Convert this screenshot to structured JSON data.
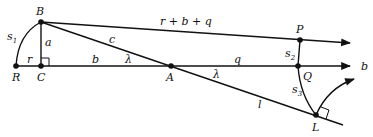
{
  "diagram": {
    "points": {
      "B": {
        "label": "B",
        "x": 41,
        "y": 22
      },
      "R": {
        "label": "R",
        "x": 16,
        "y": 66
      },
      "C": {
        "label": "C",
        "x": 41,
        "y": 66
      },
      "A": {
        "label": "A",
        "x": 171,
        "y": 66
      },
      "P": {
        "label": "P",
        "x": 300,
        "y": 40
      },
      "Q": {
        "label": "Q",
        "x": 298,
        "y": 66
      },
      "L": {
        "label": "L",
        "x": 316,
        "y": 115
      }
    },
    "labels": {
      "s1": "s",
      "s1_sub": "1",
      "s2": "s",
      "s2_sub": "2",
      "s3": "s",
      "s3_sub": "3",
      "a": "a",
      "r": "r",
      "b_segment": "b",
      "c": "c",
      "lambda_left": "λ",
      "lambda_right": "λ",
      "q": "q",
      "l": "l",
      "top_line": "r + b + q",
      "b_axis": "b"
    }
  }
}
